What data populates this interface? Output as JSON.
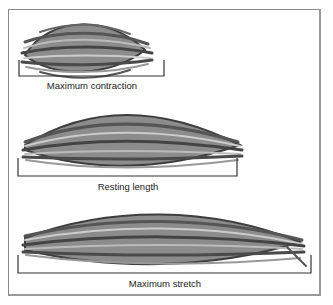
{
  "figure": {
    "panels": [
      {
        "label": "Maximum contraction"
      },
      {
        "label": "Resting length"
      },
      {
        "label": "Maximum stretch"
      }
    ]
  },
  "colors": {
    "fiber_dark": "#4a4a4a",
    "fiber_light": "#9a9a9a",
    "bracket": "#333333",
    "frame": "#8a8a8a"
  }
}
